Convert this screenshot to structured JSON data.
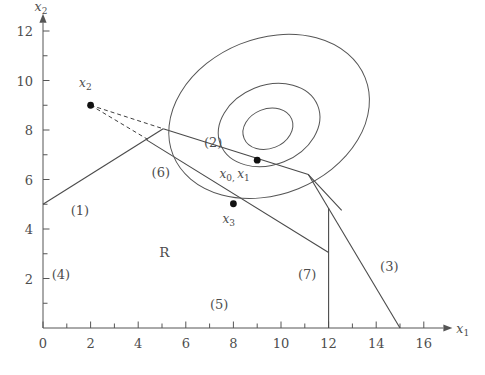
{
  "figure": {
    "background_color": "#ffffff",
    "line_color": "#4a4a4a",
    "text_color": "#4d4d4d",
    "point_color": "#111111"
  },
  "axes": {
    "x_axis": {
      "label": "x",
      "label_sub": "1",
      "min": 0,
      "max": 17.2,
      "tick_labels": [
        "0",
        "2",
        "4",
        "6",
        "8",
        "10",
        "12",
        "14",
        "16"
      ],
      "tick_values": [
        0,
        2,
        4,
        6,
        8,
        10,
        12,
        14,
        16
      ],
      "minor_tick_values": [
        1,
        3,
        5,
        7,
        9,
        11,
        13,
        15
      ],
      "arrow": true
    },
    "y_axis": {
      "label": "x",
      "label_sub": "2",
      "min": 0,
      "max": 12.7,
      "tick_labels": [
        "2",
        "4",
        "6",
        "8",
        "10",
        "12"
      ],
      "tick_values": [
        2,
        4,
        6,
        8,
        10,
        12
      ],
      "minor_tick_values": [
        1,
        3,
        5,
        7,
        9,
        11
      ],
      "arrow": true
    }
  },
  "chart_data": {
    "type": "line",
    "title": "",
    "xlabel": "x_1",
    "ylabel": "x_2",
    "xlim": [
      0,
      17.2
    ],
    "ylim": [
      0,
      12.7
    ],
    "grid": false,
    "legend": "none",
    "feasible_region_label": "R",
    "constraint_labels": [
      {
        "id": "(1)",
        "x": 1.55,
        "y": 4.55
      },
      {
        "id": "(2)",
        "x": 7.15,
        "y": 7.3
      },
      {
        "id": "(3)",
        "x": 14.55,
        "y": 2.3
      },
      {
        "id": "(4)",
        "x": 0.75,
        "y": 2.0
      },
      {
        "id": "(5)",
        "x": 7.4,
        "y": 0.75
      },
      {
        "id": "(6)",
        "x": 4.95,
        "y": 6.1
      },
      {
        "id": "(7)",
        "x": 11.1,
        "y": 2.0
      }
    ],
    "constraints": [
      {
        "name": "(1)",
        "points": [
          [
            0,
            5.0
          ],
          [
            5.05,
            8.05
          ]
        ]
      },
      {
        "name": "(6)",
        "points": [
          [
            4.35,
            7.6
          ],
          [
            12.0,
            3.05
          ]
        ]
      },
      {
        "name": "(2)",
        "points": [
          [
            5.05,
            8.05
          ],
          [
            11.15,
            6.2
          ],
          [
            12.55,
            4.75
          ]
        ]
      },
      {
        "name": "(3)",
        "points": [
          [
            11.15,
            6.2
          ],
          [
            15.0,
            0.0
          ]
        ]
      },
      {
        "name": "(7)",
        "points": [
          [
            12.0,
            4.85
          ],
          [
            12.0,
            0.0
          ]
        ]
      },
      {
        "name": "(4)",
        "points": [
          [
            0,
            0
          ],
          [
            0,
            5.0
          ]
        ]
      },
      {
        "name": "(5)",
        "points": [
          [
            0,
            0
          ],
          [
            15.0,
            0
          ]
        ]
      }
    ],
    "objective_contours": [
      {
        "level": "outer",
        "cx": 9.5,
        "cy": 8.55,
        "rx": 4.35,
        "ry": 3.15,
        "rotation_deg": -22
      },
      {
        "level": "middle",
        "cx": 9.5,
        "cy": 8.2,
        "rx": 2.2,
        "ry": 1.6,
        "rotation_deg": -22
      },
      {
        "level": "inner",
        "cx": 9.45,
        "cy": 8.05,
        "rx": 1.08,
        "ry": 0.8,
        "rotation_deg": -22
      }
    ],
    "points": [
      {
        "label": "x",
        "sub": "2",
        "x": 2.0,
        "y": 9.0,
        "label_dx": -0.22,
        "label_dy": 0.75
      },
      {
        "label": "x",
        "sub": "0,",
        "label2": "x",
        "sub2": "1",
        "x": 9.0,
        "y": 6.78,
        "label_dx": -0.95,
        "label_dy": -0.72
      },
      {
        "label": "x",
        "sub": "3",
        "x": 8.0,
        "y": 5.02,
        "label_dx": -0.2,
        "label_dy": -0.78
      }
    ],
    "dashed_paths": [
      {
        "from": [
          2.0,
          9.0
        ],
        "to": [
          5.05,
          8.05
        ]
      },
      {
        "from": [
          2.0,
          9.0
        ],
        "to": [
          4.4,
          7.62
        ]
      }
    ]
  },
  "point_labels": {
    "x2": {
      "base": "x",
      "sub": "2"
    },
    "x0x1": {
      "base1": "x",
      "sub1": "0,",
      "base2": "x",
      "sub2": "1"
    },
    "x3": {
      "base": "x",
      "sub": "3"
    }
  }
}
